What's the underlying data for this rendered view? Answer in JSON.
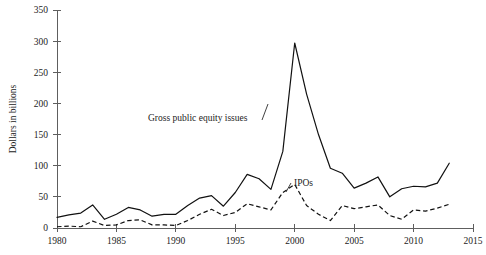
{
  "chart_data": {
    "type": "line",
    "title": "",
    "xlabel": "",
    "ylabel": "Dollars in billions",
    "xlim": [
      1980,
      2015
    ],
    "ylim": [
      0,
      350
    ],
    "grid": false,
    "legend_position": "inline-annotation",
    "xticks": [
      1980,
      1985,
      1990,
      1995,
      2000,
      2005,
      2010,
      2015
    ],
    "xtick_labels": [
      "1980",
      "1985",
      "1990",
      "1995",
      "2000",
      "2005",
      "2010",
      "2015"
    ],
    "yticks": [
      0,
      50,
      100,
      150,
      200,
      250,
      300,
      350
    ],
    "ytick_labels": [
      "0",
      "50",
      "100",
      "150",
      "200",
      "250",
      "300",
      "350"
    ],
    "x": [
      1980,
      1981,
      1982,
      1983,
      1984,
      1985,
      1986,
      1987,
      1988,
      1989,
      1990,
      1991,
      1992,
      1993,
      1994,
      1995,
      1996,
      1997,
      1998,
      1999,
      2000,
      2001,
      2002,
      2003,
      2004,
      2005,
      2006,
      2007,
      2008,
      2009,
      2010,
      2011,
      2012,
      2013
    ],
    "series": [
      {
        "name": "Gross public equity issues",
        "style": "solid",
        "annotation": "Gross public equity issues",
        "values": [
          17,
          21,
          24,
          37,
          14,
          22,
          33,
          29,
          19,
          22,
          22,
          36,
          48,
          52,
          35,
          57,
          86,
          79,
          62,
          123,
          297,
          215,
          150,
          96,
          88,
          64,
          72,
          82,
          50,
          63,
          67,
          66,
          72,
          104
        ]
      },
      {
        "name": "IPOs",
        "style": "dashed",
        "annotation": "IPOs",
        "values": [
          2,
          3,
          2,
          11,
          4,
          5,
          12,
          13,
          5,
          5,
          4,
          12,
          22,
          30,
          20,
          25,
          39,
          34,
          29,
          57,
          70,
          36,
          22,
          12,
          36,
          31,
          34,
          37,
          20,
          14,
          29,
          27,
          32,
          38
        ]
      }
    ]
  },
  "annotations": {
    "gross_label": "Gross public equity issues",
    "ipo_label": "IPOs"
  }
}
